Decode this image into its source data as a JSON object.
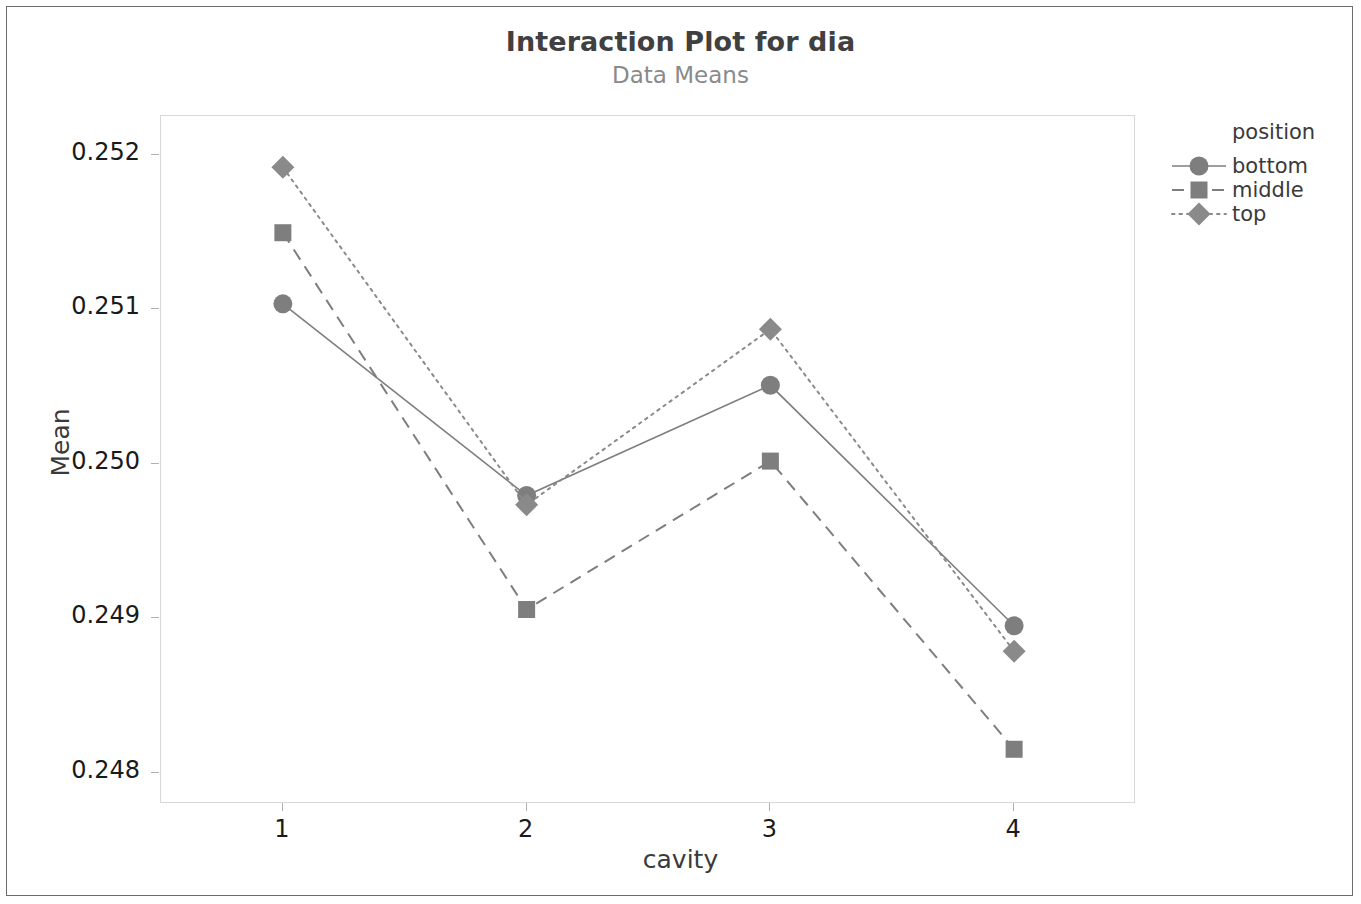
{
  "chart_data": {
    "type": "line",
    "title": "Interaction Plot for dia",
    "subtitle": "Data Means",
    "xlabel": "cavity",
    "ylabel": "Mean",
    "categories": [
      "1",
      "2",
      "3",
      "4"
    ],
    "xtick_labels": [
      "1",
      "2",
      "3",
      "4"
    ],
    "ytick_labels": [
      "0.252",
      "0.251",
      "0.250",
      "0.249",
      "0.248"
    ],
    "ytick_values": [
      0.252,
      0.251,
      0.25,
      0.249,
      0.248
    ],
    "ylim": [
      0.2478,
      0.25225
    ],
    "xlim": [
      0.5,
      4.5
    ],
    "grid": false,
    "legend_position": "right",
    "legend_title": "position",
    "series": [
      {
        "name": "bottom",
        "marker": "circle",
        "linestyle": "solid",
        "color": "#7e7e7e",
        "values": [
          0.251035,
          0.249795,
          0.250508,
          0.248953
        ]
      },
      {
        "name": "middle",
        "marker": "square",
        "linestyle": "dashed",
        "color": "#7e7e7e",
        "values": [
          0.251495,
          0.249058,
          0.250018,
          0.248154
        ]
      },
      {
        "name": "top",
        "marker": "diamond",
        "linestyle": "dotted",
        "color": "#8a8a8a",
        "values": [
          0.251918,
          0.249735,
          0.250871,
          0.248788
        ]
      }
    ]
  },
  "colors": {
    "title": "#404040",
    "subtitle": "#8a8a8a",
    "axis_text": "#1a1a1a",
    "axis_title": "#3a3a3a",
    "frame": "#d8d8d8",
    "outer_border": "#6b6b6b",
    "marker": "#7e7e7e"
  }
}
